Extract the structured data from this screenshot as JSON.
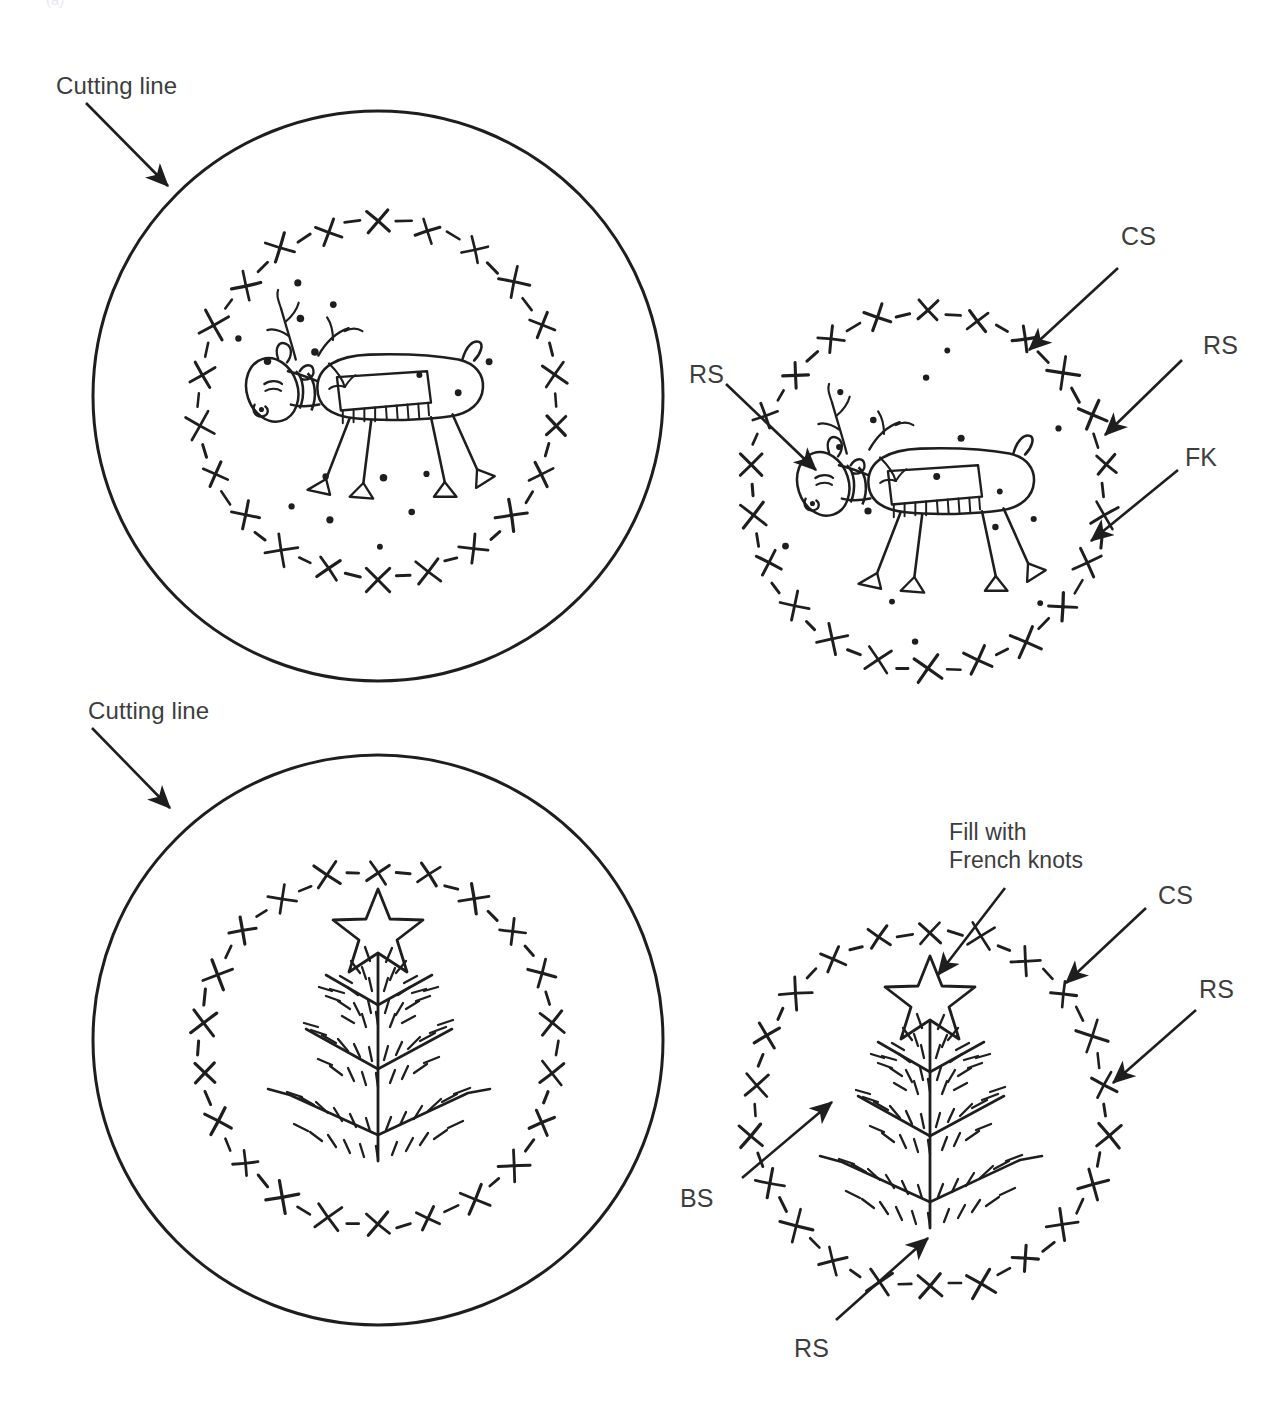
{
  "page": {
    "top_fragment": "(a)",
    "stroke_color": "#1e1e1e",
    "text_color": "#3d3d3d",
    "background": "#ffffff"
  },
  "labels": {
    "cutting_line_top": "Cutting line",
    "cutting_line_bottom": "Cutting line",
    "cs_top": "CS",
    "rs_top_right": "RS",
    "fk_top": "FK",
    "rs_top_left": "RS",
    "fill_with_french_knots_line1": "Fill with",
    "fill_with_french_knots_line2": "French knots",
    "cs_bottom": "CS",
    "rs_bottom_right": "RS",
    "bs_bottom": "BS",
    "rs_bottom": "RS"
  },
  "panels": {
    "top_left": {
      "name": "reindeer-full-circle",
      "outer_circle": {
        "cx": 378,
        "cy": 396,
        "r": 285
      },
      "stitch_circle": {
        "cx": 378,
        "cy": 400,
        "r": 178
      },
      "motif": "reindeer-with-scarf"
    },
    "top_right": {
      "name": "reindeer-detail-circle",
      "stitch_circle": {
        "cx": 928,
        "cy": 490,
        "r": 178
      },
      "motif": "reindeer-with-scarf"
    },
    "bottom_left": {
      "name": "tree-full-circle",
      "outer_circle": {
        "cx": 378,
        "cy": 1040,
        "r": 285
      },
      "stitch_circle": {
        "cx": 378,
        "cy": 1048,
        "r": 178
      },
      "motif": "christmas-tree-with-star"
    },
    "bottom_right": {
      "name": "tree-detail-circle",
      "stitch_circle": {
        "cx": 930,
        "cy": 1110,
        "r": 178
      },
      "motif": "christmas-tree-with-star"
    }
  },
  "stitch_legend": {
    "CS": "Cross stitch",
    "RS": "Running stitch",
    "FK": "French knot",
    "BS": "Back stitch"
  }
}
